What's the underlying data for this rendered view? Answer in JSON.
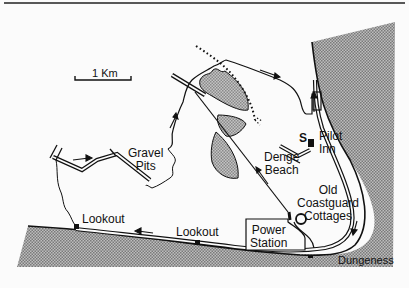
{
  "map": {
    "scale_bar": {
      "label": "1 Km"
    },
    "labels": {
      "gravel_pits": [
        "Gravel",
        "Pits"
      ],
      "pilot_inn": [
        "Pilot",
        "Inn"
      ],
      "s_marker": "S",
      "denge_beach": [
        "Denge",
        "Beach"
      ],
      "old_coastguard": [
        "Old",
        "Coastguard",
        "Cottages"
      ],
      "lookout_west": "Lookout",
      "lookout_mid": "Lookout",
      "power_station": [
        "Power",
        "Station"
      ],
      "dungeness": "Dungeness"
    },
    "colors": {
      "background": "#fbfbfb",
      "sea_fill": "#9a9a9a",
      "gravel_fill": "#a8a8a8",
      "line": "#111111"
    }
  }
}
